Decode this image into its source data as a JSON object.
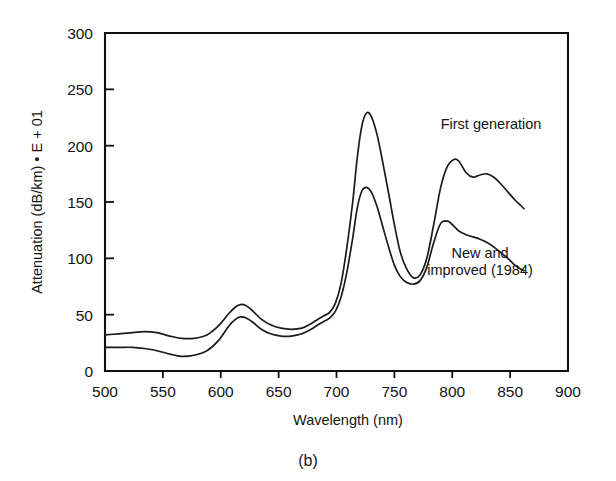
{
  "figure": {
    "caption": "(b)"
  },
  "chart_data": {
    "type": "line",
    "title": "",
    "xlabel": "Wavelength (nm)",
    "ylabel": "Attenuation (dB/km) • E + 01",
    "xlim": [
      500,
      900
    ],
    "ylim": [
      0,
      300
    ],
    "xticks": [
      500,
      550,
      600,
      650,
      700,
      750,
      800,
      850,
      900
    ],
    "yticks": [
      0,
      50,
      100,
      150,
      200,
      250,
      300
    ],
    "xticklabels": [
      "500",
      "550",
      "600",
      "650",
      "700",
      "750",
      "800",
      "850",
      "900"
    ],
    "yticklabels": [
      "0",
      "50",
      "100",
      "150",
      "200",
      "250",
      "300"
    ],
    "grid": false,
    "legend": "none",
    "annotations": [
      {
        "text": "First generation",
        "x": 790,
        "y": 215
      },
      {
        "text": "New and",
        "x": 824,
        "y": 100
      },
      {
        "text": "improved (1984)",
        "x": 824,
        "y": 85
      }
    ],
    "series": [
      {
        "name": "First generation",
        "x": [
          500,
          512,
          524,
          534,
          545,
          556,
          566,
          577,
          588,
          598,
          607,
          613,
          617,
          622,
          628,
          635,
          643,
          652,
          661,
          670,
          678,
          684,
          689,
          694,
          699,
          704,
          709,
          714,
          718,
          722,
          726,
          730,
          735,
          740,
          745,
          750,
          755,
          760,
          766,
          772,
          778,
          784,
          790,
          796,
          802,
          806,
          812,
          818,
          824,
          830,
          836,
          842,
          848,
          854,
          860,
          862
        ],
        "y": [
          32,
          33,
          34,
          35,
          34,
          31,
          29,
          29,
          32,
          40,
          51,
          57,
          59,
          58,
          53,
          46,
          41,
          38,
          37,
          38,
          42,
          46,
          49,
          52,
          60,
          78,
          110,
          150,
          190,
          218,
          229,
          226,
          210,
          185,
          158,
          130,
          106,
          92,
          83,
          85,
          100,
          130,
          163,
          182,
          188,
          186,
          176,
          172,
          174,
          175,
          172,
          166,
          159,
          152,
          146,
          144
        ]
      },
      {
        "name": "New and improved (1984)",
        "x": [
          500,
          512,
          524,
          534,
          545,
          556,
          566,
          577,
          588,
          598,
          607,
          613,
          617,
          622,
          628,
          635,
          643,
          652,
          661,
          670,
          678,
          684,
          689,
          694,
          699,
          704,
          709,
          714,
          718,
          722,
          726,
          730,
          735,
          740,
          745,
          750,
          755,
          760,
          766,
          772,
          778,
          784,
          790,
          796,
          802,
          806,
          812,
          818,
          824,
          830,
          836,
          842,
          848,
          854,
          860,
          862
        ],
        "y": [
          21,
          21,
          21,
          20,
          18,
          15,
          13,
          14,
          18,
          27,
          40,
          46,
          48,
          47,
          43,
          37,
          33,
          31,
          31,
          33,
          37,
          41,
          44,
          47,
          53,
          66,
          88,
          118,
          145,
          160,
          163,
          159,
          146,
          128,
          110,
          94,
          84,
          79,
          77,
          80,
          92,
          114,
          131,
          133,
          128,
          124,
          121,
          119,
          117,
          114,
          110,
          105,
          100,
          94,
          90,
          89
        ]
      }
    ]
  }
}
